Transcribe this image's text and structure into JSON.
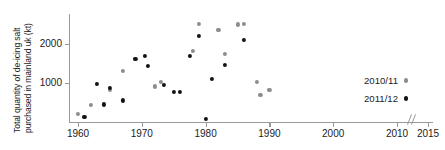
{
  "chart_data": {
    "type": "scatter",
    "title": "",
    "xlabel": "",
    "ylabel": "Total quantity of de-icing salt purchased in mainland uk (kt)",
    "ylabel_line1": "Total quantity of de-icing salt",
    "ylabel_line2": "purchased in mainland uk (kt)",
    "xlim": [
      1959,
      2015
    ],
    "ylim": [
      0,
      2650
    ],
    "grid": false,
    "axis_break": {
      "after": 2011,
      "before": 2014,
      "symbol": "//"
    },
    "legend_position": "right",
    "x_ticks": [
      1960,
      1970,
      1980,
      1990,
      2000,
      2010,
      2015
    ],
    "x_tick_labels": [
      "1960",
      "1970",
      "1980",
      "1990",
      "2000",
      "2010",
      "2015"
    ],
    "y_ticks": [
      1000,
      2000
    ],
    "y_tick_labels": [
      "1000",
      "2000"
    ],
    "series": [
      {
        "name": "2010/11",
        "color": "#8d8d8d",
        "points": [
          {
            "x": 1960,
            "y": 190
          },
          {
            "x": 1962,
            "y": 420
          },
          {
            "x": 1965,
            "y": 800
          },
          {
            "x": 1967,
            "y": 1300
          },
          {
            "x": 1972,
            "y": 900
          },
          {
            "x": 1973,
            "y": 1010
          },
          {
            "x": 1978,
            "y": 1800
          },
          {
            "x": 1979,
            "y": 2510
          },
          {
            "x": 1982,
            "y": 2340
          },
          {
            "x": 1983,
            "y": 1740
          },
          {
            "x": 1985,
            "y": 2490
          },
          {
            "x": 1986,
            "y": 2500
          },
          {
            "x": 1988,
            "y": 1020
          },
          {
            "x": 1988.6,
            "y": 680
          },
          {
            "x": 1990,
            "y": 800
          }
        ]
      },
      {
        "name": "2011/12",
        "color": "#131313",
        "points": [
          {
            "x": 1961,
            "y": 120
          },
          {
            "x": 1963,
            "y": 960
          },
          {
            "x": 1964,
            "y": 440
          },
          {
            "x": 1965,
            "y": 860
          },
          {
            "x": 1967,
            "y": 540
          },
          {
            "x": 1969,
            "y": 1600
          },
          {
            "x": 1970.5,
            "y": 1680
          },
          {
            "x": 1971,
            "y": 1430
          },
          {
            "x": 1973.5,
            "y": 940
          },
          {
            "x": 1975,
            "y": 750
          },
          {
            "x": 1976,
            "y": 750
          },
          {
            "x": 1977.5,
            "y": 1680
          },
          {
            "x": 1979,
            "y": 2200
          },
          {
            "x": 1980,
            "y": 60
          },
          {
            "x": 1981,
            "y": 1090
          },
          {
            "x": 1983,
            "y": 1460
          },
          {
            "x": 1986,
            "y": 2100
          }
        ]
      }
    ]
  },
  "legend": {
    "entries": [
      {
        "label": "2010/11",
        "marker": "circle-gray"
      },
      {
        "label": "2011/12",
        "marker": "circle-black"
      }
    ]
  },
  "colors": {
    "series_2010_11": "#8d8d8d",
    "series_2011_12": "#131313",
    "axis": "#9a9a9a",
    "text": "#1c1c1c",
    "background": "#ffffff"
  }
}
